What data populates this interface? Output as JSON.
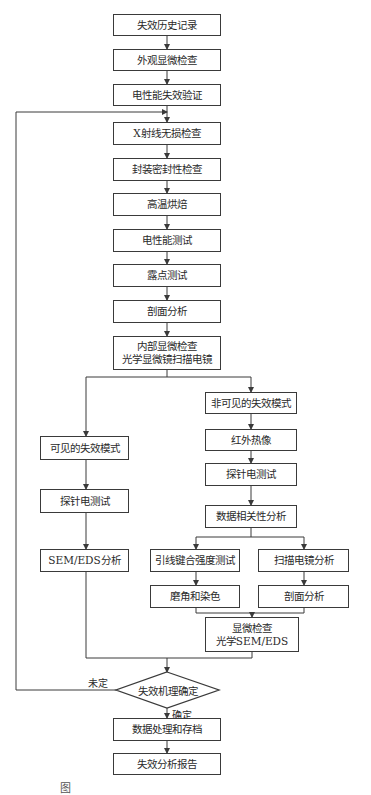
{
  "flowchart": {
    "main_steps": [
      {
        "id": "history",
        "label": "失效历史记录"
      },
      {
        "id": "visual",
        "label": "外观显微检查"
      },
      {
        "id": "electrical_verify",
        "label": "电性能失效验证"
      },
      {
        "id": "xray",
        "label": "X射线无损检查"
      },
      {
        "id": "hermetic",
        "label": "封装密封性检查"
      },
      {
        "id": "bake",
        "label": "高温烘焙"
      },
      {
        "id": "electrical_test",
        "label": "电性能测试"
      },
      {
        "id": "dewpoint",
        "label": "露点测试"
      },
      {
        "id": "cross_section",
        "label": "剖面分析"
      },
      {
        "id": "internal",
        "lines": [
          "内部显微检查",
          "光学显微镜扫描电镜"
        ]
      }
    ],
    "left_branch": [
      {
        "id": "visible_mode",
        "label": "可见的失效模式"
      },
      {
        "id": "probe_left",
        "label": "探针电测试"
      },
      {
        "id": "sem_eds",
        "label": "SEM/EDS分析"
      }
    ],
    "right_branch": [
      {
        "id": "invisible_mode",
        "label": "非可见的失效模式"
      },
      {
        "id": "infrared",
        "label": "红外热像"
      },
      {
        "id": "probe_right",
        "label": "探针电测试"
      },
      {
        "id": "data_corr",
        "label": "数据相关性分析"
      }
    ],
    "sub_branch": {
      "left": [
        {
          "id": "wire_bond",
          "label": "引线键合强度测试"
        },
        {
          "id": "bevel_stain",
          "label": "磨角和染色"
        }
      ],
      "right": [
        {
          "id": "sem_analysis",
          "label": "扫描电镜分析"
        },
        {
          "id": "cross_section_2",
          "label": "剖面分析"
        }
      ]
    },
    "micro_check": {
      "lines": [
        "显微检查",
        "光学SEM/EDS"
      ]
    },
    "decision": {
      "label": "失效机理确定",
      "no_label": "未定",
      "yes_label": "确定"
    },
    "final_steps": [
      {
        "id": "data_archive",
        "label": "数据处理和存档"
      },
      {
        "id": "report",
        "label": "失效分析报告"
      }
    ],
    "caption": "图"
  }
}
